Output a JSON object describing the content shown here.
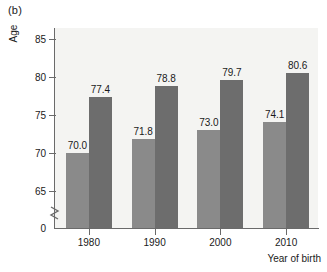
{
  "figure": {
    "panel_label": "(b)",
    "background_color": "#ffffff",
    "plot_background_color": "#f4f4f2",
    "axis_color": "#6a6a6a"
  },
  "chart_data": {
    "type": "bar",
    "title": "",
    "subtitle": "",
    "xlabel": "Year of birth",
    "ylabel": "Age",
    "categories": [
      "1980",
      "1990",
      "2000",
      "2010"
    ],
    "series": [
      {
        "name": "series-light",
        "color": "#8a8a8a",
        "values": [
          70.0,
          71.8,
          73.0,
          74.1
        ],
        "labels": [
          "70.0",
          "71.8",
          "73.0",
          "74.1"
        ]
      },
      {
        "name": "series-dark",
        "color": "#6d6d6d",
        "values": [
          77.4,
          78.8,
          79.7,
          80.6
        ],
        "labels": [
          "77.4",
          "78.8",
          "79.7",
          "80.6"
        ]
      }
    ],
    "ylim": [
      63.0,
      86.5
    ],
    "yticks": [
      85,
      80,
      75,
      70,
      65
    ],
    "ytick_labels": [
      "85",
      "80",
      "75",
      "70",
      "65"
    ],
    "y_axis_break": true,
    "y_origin_label": "0",
    "grid": false,
    "legend": "none",
    "data_labels": true
  }
}
